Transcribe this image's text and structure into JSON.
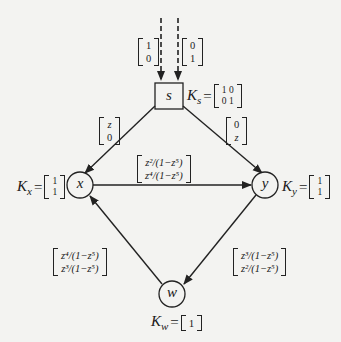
{
  "diagram": {
    "type": "directed-graph",
    "colors": {
      "background": "#f3f3f1",
      "stroke": "#222222"
    },
    "nodes": [
      {
        "id": "s",
        "label": "s",
        "shape": "square",
        "K": {
          "name": "K",
          "sub": "s",
          "matrix": [
            [
              "1 0"
            ],
            [
              "0 1"
            ]
          ],
          "rows": [
            "1 0",
            "0 1"
          ]
        }
      },
      {
        "id": "x",
        "label": "x",
        "shape": "circle",
        "K": {
          "name": "K",
          "sub": "x",
          "rows": [
            "1",
            "1"
          ]
        }
      },
      {
        "id": "y",
        "label": "y",
        "shape": "circle",
        "K": {
          "name": "K",
          "sub": "y",
          "rows": [
            "1",
            "1"
          ]
        }
      },
      {
        "id": "w",
        "label": "w",
        "shape": "circle",
        "K": {
          "name": "K",
          "sub": "w",
          "rows": [
            "1"
          ]
        }
      }
    ],
    "inputs": [
      {
        "to": "s",
        "style": "dashed",
        "vector": [
          "1",
          "0"
        ]
      },
      {
        "to": "s",
        "style": "dashed",
        "vector": [
          "0",
          "1"
        ]
      }
    ],
    "edges": [
      {
        "from": "s",
        "to": "x",
        "vector": [
          "z",
          "0"
        ]
      },
      {
        "from": "s",
        "to": "y",
        "vector": [
          "0",
          "z"
        ]
      },
      {
        "from": "x",
        "to": "y",
        "vector": [
          "z²/(1−z⁵)",
          "z⁴/(1−z⁵)"
        ]
      },
      {
        "from": "y",
        "to": "w",
        "vector": [
          "z³/(1−z⁵)",
          "z²/(1−z⁵)"
        ]
      },
      {
        "from": "w",
        "to": "x",
        "vector": [
          "z⁴/(1−z⁵)",
          "z³/(1−z⁵)"
        ]
      }
    ],
    "eq": "="
  }
}
